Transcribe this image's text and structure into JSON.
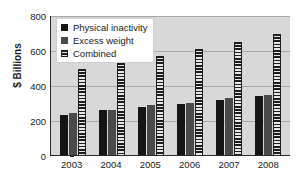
{
  "chart_data": {
    "type": "bar",
    "title": "",
    "subtitle": "",
    "xlabel": "",
    "ylabel": "$ Billions",
    "categories": [
      "2003",
      "2004",
      "2005",
      "2006",
      "2007",
      "2008"
    ],
    "series": [
      {
        "name": "Physical inactivity",
        "color": "#151515",
        "fill": "solid-black",
        "values": [
          230,
          255,
          275,
          290,
          315,
          337
        ]
      },
      {
        "name": "Excess weight",
        "color": "#4a4a4a",
        "fill": "solid-gray",
        "values": [
          238,
          260,
          285,
          300,
          325,
          345
        ]
      },
      {
        "name": "Combined",
        "color": "#1d1d1d",
        "fill": "horizontal-stripes",
        "values": [
          490,
          528,
          565,
          608,
          643,
          692
        ]
      }
    ],
    "ylim": [
      0,
      800
    ],
    "yticks": [
      0,
      200,
      400,
      600,
      800
    ],
    "ytick_labels": [
      "0",
      "200",
      "400",
      "600",
      "800"
    ],
    "grid": true,
    "grid_orientation": "horizontal",
    "legend_position": "upper-left",
    "plot_background": "#d8d8d8",
    "figure_background": "#ffffff"
  },
  "legend": {
    "items": [
      {
        "label": "Physical inactivity"
      },
      {
        "label": "Excess weight"
      },
      {
        "label": "Combined"
      }
    ]
  }
}
